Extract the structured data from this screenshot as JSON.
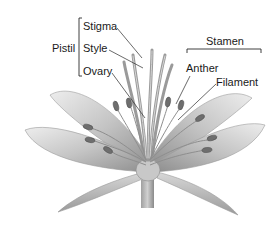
{
  "diagram": {
    "groups": [
      {
        "name": "Pistil",
        "parts": [
          "Stigma",
          "Style",
          "Ovary"
        ]
      },
      {
        "name": "Stamen",
        "parts": [
          "Anther",
          "Filament"
        ]
      }
    ],
    "labels": {
      "pistil": "Pistil",
      "stigma": "Stigma",
      "style": "Style",
      "ovary": "Ovary",
      "stamen": "Stamen",
      "anther": "Anther",
      "filament": "Filament"
    },
    "colors": {
      "text": "#1a1a1a",
      "leader_line": "#2a2a2a",
      "petal_light": "#e6e6e6",
      "petal_mid": "#b8b8b8",
      "petal_dark": "#8a8a8a",
      "anther": "#6e6e6e"
    }
  }
}
